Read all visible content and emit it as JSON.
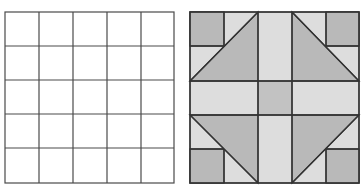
{
  "figure": {
    "left_panel": {
      "label": "empty-5x5-grid",
      "rows": 5,
      "cols": 5
    },
    "right_panel": {
      "label": "quilt-block-pattern",
      "rows": 5,
      "cols": 5
    },
    "colors": {
      "line": "#3a3a3a",
      "dark_fill": "#b9b9b9",
      "light_fill": "#dddddd",
      "background": "#ffffff"
    }
  }
}
